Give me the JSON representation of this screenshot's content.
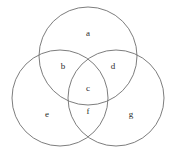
{
  "figure": {
    "width": 175,
    "height": 154,
    "background_color": "#ffffff",
    "stroke_color": "#6e6e6e",
    "stroke_width": 0.9,
    "label_color": "#2b2b2b"
  },
  "circles": [
    {
      "name": "top-circle",
      "cx": 88,
      "cy": 56,
      "r": 49
    },
    {
      "name": "left-circle",
      "cx": 60,
      "cy": 98,
      "r": 48
    },
    {
      "name": "right-circle",
      "cx": 116,
      "cy": 98,
      "r": 48
    }
  ],
  "regions": [
    {
      "id": "a",
      "label": "a",
      "x": 88,
      "y": 33,
      "belongs_to": [
        "top-circle"
      ]
    },
    {
      "id": "b",
      "label": "b",
      "x": 63,
      "y": 66,
      "belongs_to": [
        "top-circle",
        "left-circle"
      ]
    },
    {
      "id": "d",
      "label": "d",
      "x": 113,
      "y": 66,
      "belongs_to": [
        "top-circle",
        "right-circle"
      ]
    },
    {
      "id": "c",
      "label": "c",
      "x": 88,
      "y": 88,
      "belongs_to": [
        "top-circle",
        "left-circle",
        "right-circle"
      ]
    },
    {
      "id": "e",
      "label": "e",
      "x": 47,
      "y": 114,
      "belongs_to": [
        "left-circle"
      ]
    },
    {
      "id": "f",
      "label": "f",
      "x": 88,
      "y": 111,
      "belongs_to": [
        "left-circle",
        "right-circle"
      ]
    },
    {
      "id": "g",
      "label": "g",
      "x": 131,
      "y": 114,
      "belongs_to": [
        "right-circle"
      ]
    }
  ]
}
